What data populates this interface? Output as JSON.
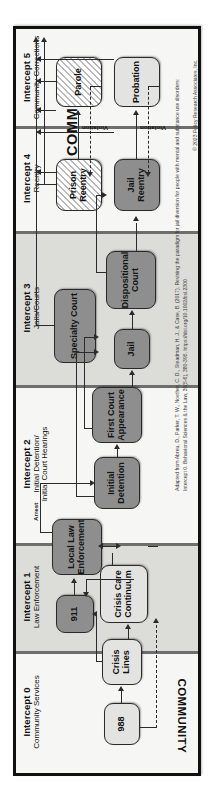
{
  "diagram": {
    "community_label_top": "COMMUNITY",
    "community_label_bottom": "COMMUNITY"
  },
  "intercepts": [
    {
      "id": "intercept-0",
      "number": "Intercept 0",
      "subtitle": "Community Services"
    },
    {
      "id": "intercept-1",
      "number": "Intercept 1",
      "subtitle": "Law Enforcement"
    },
    {
      "id": "intercept-2",
      "number": "Intercept 2",
      "subtitle": "Initial Detention/\nInitial Court Hearings",
      "subtitle_line1": "Initial Detention/",
      "subtitle_line2": "Initial Court Hearings"
    },
    {
      "id": "intercept-3",
      "number": "Intercept 3",
      "subtitle": "Jails/Courts"
    },
    {
      "id": "intercept-4",
      "number": "Intercept 4",
      "subtitle": "Reentry"
    },
    {
      "id": "intercept-5",
      "number": "Intercept 5",
      "subtitle": "Community Corrections"
    }
  ],
  "nodes": {
    "n988": "988",
    "crisis_lines_l1": "Crisis",
    "crisis_lines_l2": "Lines",
    "crisis_care_l1": "Crisis Care",
    "crisis_care_l2": "Continuum",
    "n911": "911",
    "local_law_l1": "Local Law",
    "local_law_l2": "Enforcement",
    "initial_detention_l1": "Initial",
    "initial_detention_l2": "Detention",
    "first_court_l1": "First Court",
    "first_court_l2": "Appearance",
    "specialty_court": "Specialty Court",
    "jail": "Jail",
    "dispositional_l1": "Dispositional",
    "dispositional_l2": "Court",
    "prison_reentry_l1": "Prison",
    "prison_reentry_l2": "Reentry",
    "jail_reentry_l1": "Jail",
    "jail_reentry_l2": "Reentry",
    "parole": "Parole",
    "probation": "Probation"
  },
  "edge_labels": {
    "arrest": "Arrest",
    "violation_parole": "Violation",
    "violation_probation": "Violation"
  },
  "footer": {
    "citation": "Adapted from Abreu, D., Parker, T. W., Noether, C. D., Steadman, H. J., & Case, B. (2017). Revising the paradigm for jail diversion for people with mental and substance use disorders: Intercept 0. Behavioral Sciences & the Law, 35(5-6), 380-395. https://doi.org/10.1002/bsl.2300",
    "copyright": "© 2023 Policy Research Associates, Inc."
  },
  "colors": {
    "band_light": "#f6f6f4",
    "band_shade": "#dcdcd8",
    "node_dark": "#8e8e8e",
    "node_mid": "#bdbdbd",
    "node_light": "#e3e3e1",
    "border": "#111111"
  }
}
